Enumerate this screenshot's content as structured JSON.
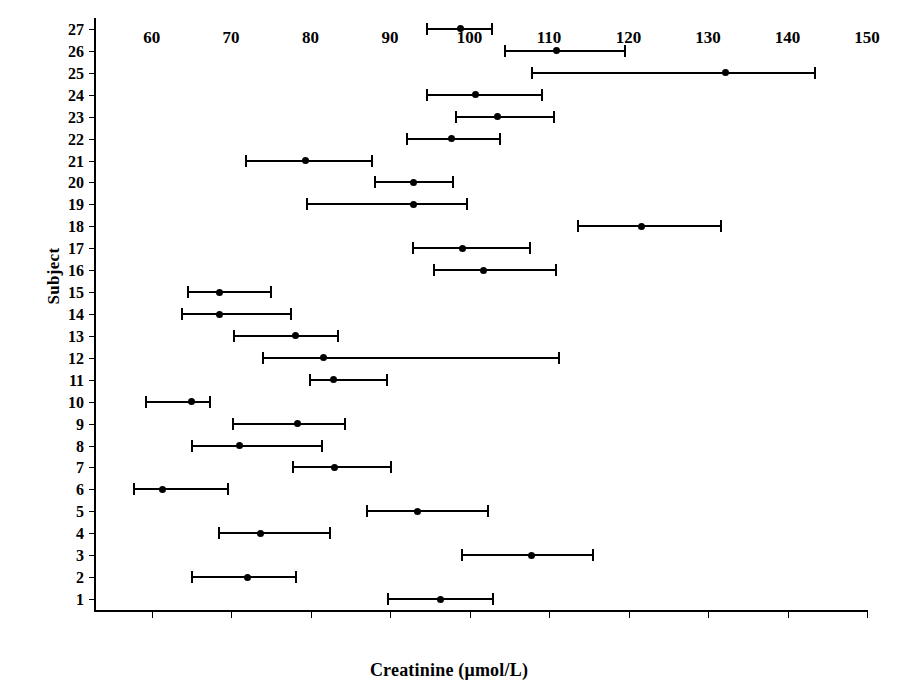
{
  "chart_data": {
    "type": "bar",
    "orientation": "horizontal",
    "subtype": "error-bar-confidence-interval",
    "title": "",
    "xlabel": "Creatinine (μmol/L)",
    "ylabel": "Subject",
    "xlim": [
      53,
      150
    ],
    "ylim": [
      0.5,
      27.5
    ],
    "grid": false,
    "legend": null,
    "xticks": [
      60,
      70,
      80,
      90,
      100,
      110,
      120,
      130,
      140,
      150
    ],
    "xtick_labels": [
      "60",
      "70",
      "80",
      "90",
      "100",
      "110",
      "120",
      "130",
      "140",
      "150"
    ],
    "yticks": [
      1,
      2,
      3,
      4,
      5,
      6,
      7,
      8,
      9,
      10,
      11,
      12,
      13,
      14,
      15,
      16,
      17,
      18,
      19,
      20,
      21,
      22,
      23,
      24,
      25,
      26,
      27
    ],
    "ytick_labels": [
      "1",
      "2",
      "3",
      "4",
      "5",
      "6",
      "7",
      "8",
      "9",
      "10",
      "11",
      "12",
      "13",
      "14",
      "15",
      "16",
      "17",
      "18",
      "19",
      "20",
      "21",
      "22",
      "23",
      "24",
      "25",
      "26",
      "27"
    ],
    "categories": [
      "1",
      "2",
      "3",
      "4",
      "5",
      "6",
      "7",
      "8",
      "9",
      "10",
      "11",
      "12",
      "13",
      "14",
      "15",
      "16",
      "17",
      "18",
      "19",
      "20",
      "21",
      "22",
      "23",
      "24",
      "25",
      "26",
      "27"
    ],
    "series": [
      {
        "name": "Creatinine mean with range",
        "color": "#000000",
        "points": [
          {
            "subject": 1,
            "lower": 89.6,
            "value": 96.3,
            "upper": 103.1
          },
          {
            "subject": 2,
            "lower": 65.0,
            "value": 72.1,
            "upper": 78.3
          },
          {
            "subject": 3,
            "lower": 98.9,
            "value": 107.8,
            "upper": 115.6
          },
          {
            "subject": 4,
            "lower": 68.4,
            "value": 73.7,
            "upper": 82.6
          },
          {
            "subject": 5,
            "lower": 87.0,
            "value": 93.5,
            "upper": 102.5
          },
          {
            "subject": 6,
            "lower": 57.7,
            "value": 61.4,
            "upper": 69.7
          },
          {
            "subject": 7,
            "lower": 77.7,
            "value": 83.0,
            "upper": 90.3
          },
          {
            "subject": 8,
            "lower": 64.9,
            "value": 71.0,
            "upper": 81.6
          },
          {
            "subject": 9,
            "lower": 70.1,
            "value": 78.3,
            "upper": 84.4
          },
          {
            "subject": 10,
            "lower": 59.2,
            "value": 65.0,
            "upper": 67.5
          },
          {
            "subject": 11,
            "lower": 79.8,
            "value": 82.9,
            "upper": 89.7
          },
          {
            "subject": 12,
            "lower": 73.9,
            "value": 81.6,
            "upper": 111.4
          },
          {
            "subject": 13,
            "lower": 70.2,
            "value": 78.1,
            "upper": 83.6
          },
          {
            "subject": 14,
            "lower": 63.7,
            "value": 68.5,
            "upper": 77.7
          },
          {
            "subject": 15,
            "lower": 64.5,
            "value": 68.5,
            "upper": 75.1
          },
          {
            "subject": 16,
            "lower": 95.4,
            "value": 101.7,
            "upper": 111.0
          },
          {
            "subject": 17,
            "lower": 92.8,
            "value": 99.1,
            "upper": 107.7
          },
          {
            "subject": 18,
            "lower": 113.5,
            "value": 121.6,
            "upper": 131.7
          },
          {
            "subject": 19,
            "lower": 79.4,
            "value": 93.0,
            "upper": 99.8
          },
          {
            "subject": 20,
            "lower": 88.0,
            "value": 93.0,
            "upper": 98.1
          },
          {
            "subject": 21,
            "lower": 71.8,
            "value": 79.4,
            "upper": 87.9
          },
          {
            "subject": 22,
            "lower": 92.0,
            "value": 97.7,
            "upper": 103.9
          },
          {
            "subject": 23,
            "lower": 98.2,
            "value": 103.5,
            "upper": 110.8
          },
          {
            "subject": 24,
            "lower": 94.5,
            "value": 100.7,
            "upper": 109.2
          },
          {
            "subject": 25,
            "lower": 107.7,
            "value": 132.2,
            "upper": 143.6
          },
          {
            "subject": 26,
            "lower": 104.3,
            "value": 110.9,
            "upper": 119.7
          },
          {
            "subject": 27,
            "lower": 94.5,
            "value": 98.8,
            "upper": 102.9
          }
        ]
      }
    ]
  },
  "axis": {
    "x_title": "Creatinine (μmol/L)",
    "y_title": "Subject"
  },
  "style": {
    "line_color": "#000000",
    "marker_color": "#000000",
    "background": "#ffffff"
  }
}
